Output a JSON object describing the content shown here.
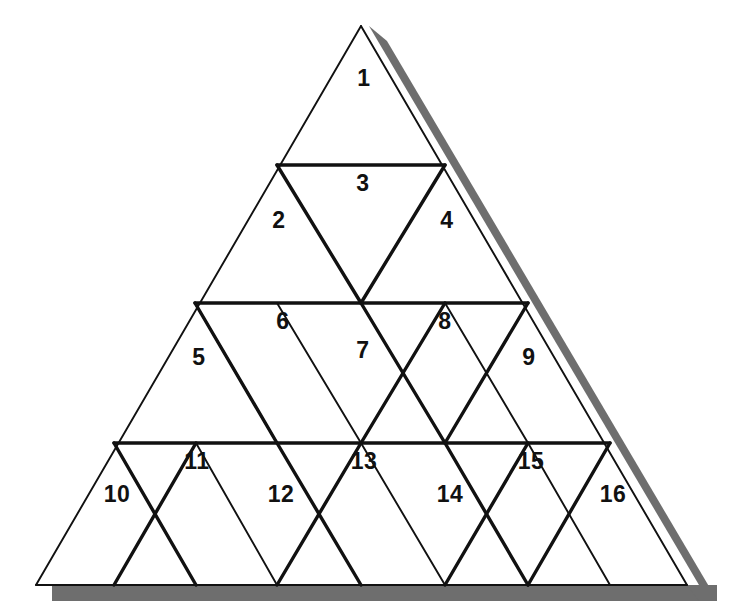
{
  "figure": {
    "kind": "subdivided-triangle-diagram",
    "rows": 4,
    "cell_count": 16,
    "background_color": "#FFFFFF",
    "line_color": "#111111",
    "shadow_color": "#6E6E6E",
    "label_color": "#111111",
    "thin_stroke_px": 1.8,
    "thick_stroke_px": 3.4,
    "outline": {
      "apex": [
        361,
        26
      ],
      "bottom_left": [
        36,
        585
      ],
      "bottom_right": [
        687,
        585
      ]
    },
    "row_baselines_y": [
      26,
      165,
      303,
      443,
      585
    ],
    "shadow": {
      "offset_x": 30,
      "offset_y": 15,
      "band_thickness_px": 15,
      "sides": [
        "right-hypotenuse",
        "bottom"
      ]
    }
  },
  "cells": [
    {
      "id": 1,
      "label": "1",
      "orientation": "up",
      "row": 1,
      "col": 1,
      "label_x": 364,
      "label_y": 80
    },
    {
      "id": 2,
      "label": "2",
      "orientation": "up",
      "row": 2,
      "col": 1,
      "label_x": 279,
      "label_y": 222
    },
    {
      "id": 3,
      "label": "3",
      "orientation": "down",
      "row": 2,
      "col": 2,
      "label_x": 363,
      "label_y": 185
    },
    {
      "id": 4,
      "label": "4",
      "orientation": "up",
      "row": 2,
      "col": 3,
      "label_x": 447,
      "label_y": 222
    },
    {
      "id": 5,
      "label": "5",
      "orientation": "up",
      "row": 3,
      "col": 1,
      "label_x": 199,
      "label_y": 359
    },
    {
      "id": 6,
      "label": "6",
      "orientation": "down",
      "row": 3,
      "col": 2,
      "label_x": 283,
      "label_y": 323
    },
    {
      "id": 7,
      "label": "7",
      "orientation": "up",
      "row": 3,
      "col": 3,
      "label_x": 363,
      "label_y": 352
    },
    {
      "id": 8,
      "label": "8",
      "orientation": "down",
      "row": 3,
      "col": 4,
      "label_x": 445,
      "label_y": 323
    },
    {
      "id": 9,
      "label": "9",
      "orientation": "up",
      "row": 3,
      "col": 5,
      "label_x": 529,
      "label_y": 359
    },
    {
      "id": 10,
      "label": "10",
      "orientation": "up",
      "row": 4,
      "col": 1,
      "label_x": 117,
      "label_y": 496
    },
    {
      "id": 11,
      "label": "11",
      "orientation": "down",
      "row": 4,
      "col": 2,
      "label_x": 197,
      "label_y": 463
    },
    {
      "id": 12,
      "label": "12",
      "orientation": "up",
      "row": 4,
      "col": 3,
      "label_x": 281,
      "label_y": 496
    },
    {
      "id": 13,
      "label": "13",
      "orientation": "down",
      "row": 4,
      "col": 4,
      "label_x": 364,
      "label_y": 463
    },
    {
      "id": 14,
      "label": "14",
      "orientation": "up",
      "row": 4,
      "col": 5,
      "label_x": 450,
      "label_y": 496
    },
    {
      "id": 15,
      "label": "15",
      "orientation": "down",
      "row": 4,
      "col": 6,
      "label_x": 531,
      "label_y": 463
    },
    {
      "id": 16,
      "label": "16",
      "orientation": "up",
      "row": 4,
      "col": 7,
      "label_x": 613,
      "label_y": 496
    }
  ],
  "segments": {
    "horizontals": [
      {
        "name": "row2-top",
        "x1": 277,
        "y1": 165,
        "x2": 445,
        "y2": 165,
        "weight": "thick"
      },
      {
        "name": "row3-top",
        "x1": 195,
        "y1": 303,
        "x2": 528,
        "y2": 303,
        "weight": "thick"
      },
      {
        "name": "row4-top",
        "x1": 114,
        "y1": 443,
        "x2": 610,
        "y2": 443,
        "weight": "thick"
      }
    ]
  }
}
